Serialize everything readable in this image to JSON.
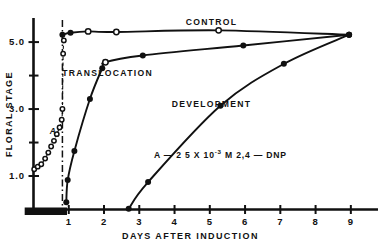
{
  "chart_data": {
    "type": "line",
    "title": "",
    "xlabel": "DAYS AFTER INDUCTION",
    "ylabel": "FLORAL STAGE",
    "xlim": [
      0,
      9.6
    ],
    "ylim": [
      0,
      5.6
    ],
    "grid": false,
    "legend_position": "inline-labels",
    "x_ticks": [
      "1",
      "2",
      "3",
      "4",
      "5",
      "6",
      "7",
      "8",
      "9"
    ],
    "x_tick_values": [
      1,
      2,
      3,
      4,
      5,
      6,
      7,
      8,
      9
    ],
    "y_ticks": [
      "5.0",
      "3.0",
      "1.0"
    ],
    "y_tick_values": [
      5.0,
      3.0,
      1.0
    ],
    "y_minor_tick_values": [
      4.0,
      2.0
    ],
    "annotations": [
      {
        "name": "dnp-annotation",
        "text_prefix": "A — 2 5 X 10",
        "text_sup": "-3",
        "text_suffix": " M  2,4 — DNP",
        "x": 5.3,
        "y": 1.55
      },
      {
        "name": "treatment-marker-label",
        "text": "A",
        "x": 0.55,
        "y": 2.25
      }
    ],
    "treatment_bar": {
      "name": "treatment-period-bar",
      "x_start": -0.25,
      "x_end": 0.95,
      "label": ""
    },
    "reference_line": {
      "name": "dnp-application-line",
      "x": 0.82,
      "style": "dash-dot"
    },
    "series": [
      {
        "name": "CONTROL",
        "label": "CONTROL",
        "label_x": 5.05,
        "label_y": 5.5,
        "marker": "mixed",
        "points": [
          {
            "x": 0.82,
            "y": 5.22,
            "fill": "solid"
          },
          {
            "x": 1.05,
            "y": 5.28,
            "fill": "solid"
          },
          {
            "x": 1.55,
            "y": 5.32,
            "fill": "open"
          },
          {
            "x": 2.35,
            "y": 5.3,
            "fill": "open"
          },
          {
            "x": 5.25,
            "y": 5.35,
            "fill": "open"
          },
          {
            "x": 8.95,
            "y": 5.22,
            "fill": "solid"
          }
        ]
      },
      {
        "name": "TRANSLOCATION",
        "label": "TRANSLOCATION",
        "label_x": 2.1,
        "label_y": 4.0,
        "marker": "mixed",
        "points": [
          {
            "x": 0.93,
            "y": 0.22,
            "fill": "solid"
          },
          {
            "x": 0.97,
            "y": 0.88,
            "fill": "solid"
          },
          {
            "x": 1.16,
            "y": 1.75,
            "fill": "solid"
          },
          {
            "x": 1.6,
            "y": 3.3,
            "fill": "solid"
          },
          {
            "x": 1.95,
            "y": 4.22,
            "fill": "solid"
          },
          {
            "x": 2.04,
            "y": 4.4,
            "fill": "open"
          },
          {
            "x": 3.1,
            "y": 4.6,
            "fill": "solid"
          },
          {
            "x": 5.95,
            "y": 4.9,
            "fill": "solid"
          },
          {
            "x": 8.95,
            "y": 5.22,
            "fill": "solid"
          }
        ]
      },
      {
        "name": "DEVELOPMENT",
        "label": "DEVELOPMENT",
        "label_x": 5.05,
        "label_y": 3.05,
        "marker": "solid",
        "points": [
          {
            "x": 2.7,
            "y": 0.02,
            "fill": "solid"
          },
          {
            "x": 3.25,
            "y": 0.82,
            "fill": "solid"
          },
          {
            "x": 5.3,
            "y": 3.1,
            "fill": "solid"
          },
          {
            "x": 7.1,
            "y": 4.35,
            "fill": "solid"
          },
          {
            "x": 8.95,
            "y": 5.22,
            "fill": "solid"
          }
        ]
      },
      {
        "name": "A-TREATMENT",
        "label": "A",
        "marker": "open-small",
        "points": [
          {
            "x": 0.02,
            "y": 1.2,
            "fill": "open"
          },
          {
            "x": 0.12,
            "y": 1.28,
            "fill": "open"
          },
          {
            "x": 0.22,
            "y": 1.35,
            "fill": "open"
          },
          {
            "x": 0.33,
            "y": 1.52,
            "fill": "open"
          },
          {
            "x": 0.42,
            "y": 1.7,
            "fill": "open"
          },
          {
            "x": 0.5,
            "y": 1.88,
            "fill": "open"
          },
          {
            "x": 0.58,
            "y": 2.05,
            "fill": "open"
          },
          {
            "x": 0.66,
            "y": 2.25,
            "fill": "open"
          },
          {
            "x": 0.74,
            "y": 2.45,
            "fill": "open"
          },
          {
            "x": 0.8,
            "y": 2.68,
            "fill": "open"
          },
          {
            "x": 0.82,
            "y": 3.0,
            "fill": "open"
          },
          {
            "x": 0.84,
            "y": 4.65,
            "fill": "open"
          },
          {
            "x": 0.86,
            "y": 5.05,
            "fill": "open"
          }
        ]
      }
    ]
  }
}
